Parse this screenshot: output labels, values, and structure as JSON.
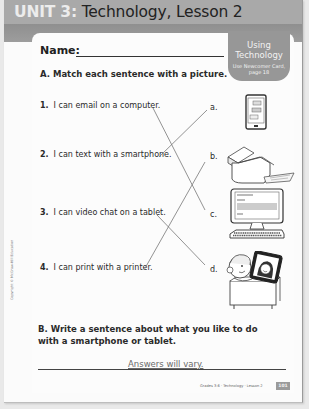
{
  "header": {
    "unit": "UNIT 3:",
    "title": "Technology, Lesson 2"
  },
  "badge": {
    "title_line1": "Using",
    "title_line2": "Technology",
    "sub_line1": "Use Newcomer Card,",
    "sub_line2": "page 18"
  },
  "name_field": {
    "label": "Name:",
    "value": ""
  },
  "section_a": {
    "heading": "A. Match each sentence with a picture.",
    "sentences": [
      {
        "num": "1.",
        "text": "I can email on a computer."
      },
      {
        "num": "2.",
        "text": "I can text with a smartphone."
      },
      {
        "num": "3.",
        "text": "I can video chat on a tablet."
      },
      {
        "num": "4.",
        "text": "I can print with a printer."
      }
    ],
    "letters": [
      "a.",
      "b.",
      "c.",
      "d."
    ],
    "pictures": [
      "smartphone",
      "printer",
      "desktop-computer",
      "child-video-chatting-on-tablet"
    ],
    "matches": [
      {
        "sentence": "1",
        "letter": "c"
      },
      {
        "sentence": "2",
        "letter": "a"
      },
      {
        "sentence": "3",
        "letter": "d"
      },
      {
        "sentence": "4",
        "letter": "b"
      }
    ]
  },
  "section_b": {
    "heading": "B. Write a sentence about what you like to do with a smartphone or tablet.",
    "answer": "Answers will vary."
  },
  "footer": {
    "text": "Grades 3-6 · Technology · Lesson 2",
    "page": "101"
  },
  "copyright": "Copyright © McGraw-Hill Education",
  "colors": {
    "header_bg": "#a9a9a9",
    "band_bg": "#959595",
    "badge_bg": "#979797",
    "text": "#2a2a2a"
  }
}
